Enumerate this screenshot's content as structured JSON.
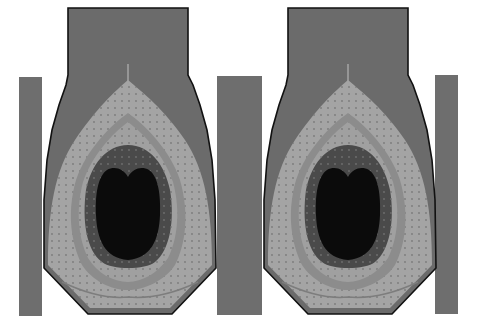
{
  "figure": {
    "panels": [
      {
        "id": "left",
        "offset_x": 0
      },
      {
        "id": "right",
        "offset_x": 220
      }
    ],
    "side_bars": [
      {
        "id": "bar-left",
        "x": 19,
        "y": 77,
        "w": 23,
        "h": 239
      },
      {
        "id": "bar-middle",
        "x": 217,
        "y": 76,
        "w": 45,
        "h": 239
      },
      {
        "id": "bar-right",
        "x": 435,
        "y": 75,
        "w": 23,
        "h": 239
      }
    ],
    "contour_levels": [
      {
        "name": "outer-shell",
        "color": "#6b6b6b"
      },
      {
        "name": "zone-1",
        "color": "#a4a4a4"
      },
      {
        "name": "zone-2",
        "color": "#8c8c8c"
      },
      {
        "name": "zone-3",
        "color": "#a0a0a0"
      },
      {
        "name": "zone-4",
        "color": "#4a4a4a"
      },
      {
        "name": "core",
        "color": "#0b0b0b"
      }
    ],
    "colors": {
      "background": "#ffffff",
      "outline": "#111111",
      "bar": "#6e6e6e",
      "stem": "#6b6b6b"
    }
  }
}
